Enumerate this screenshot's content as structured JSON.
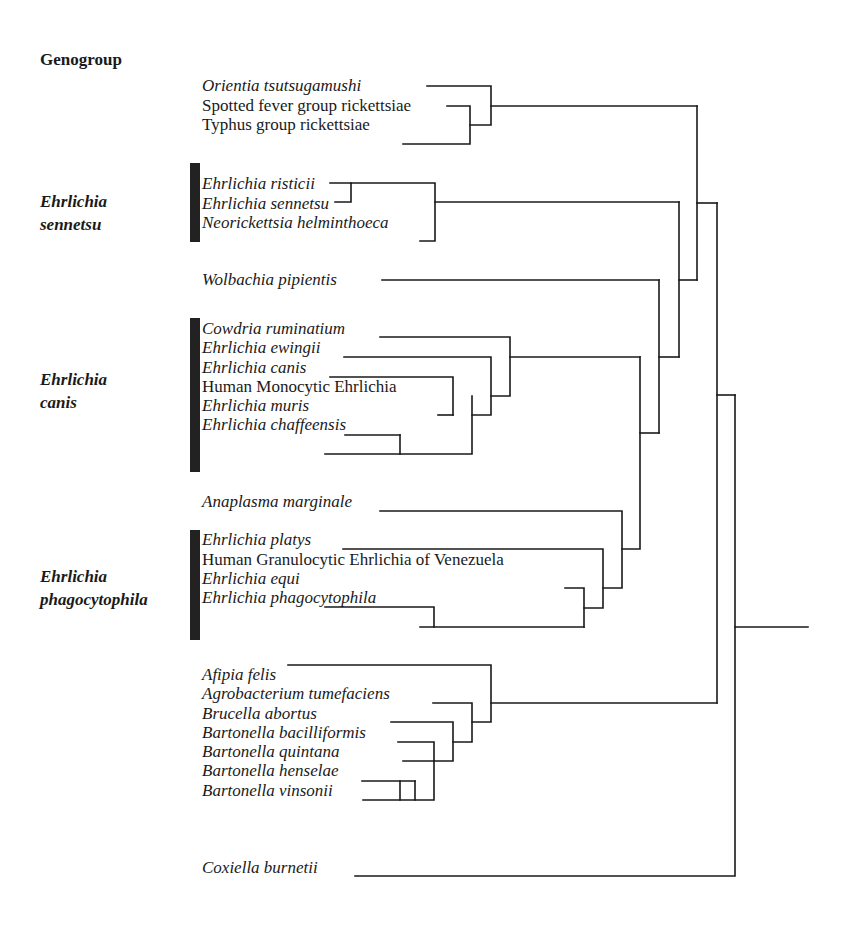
{
  "header": {
    "title": "Genogroup"
  },
  "groups": [
    {
      "name": "Ehrlichia sennetsu",
      "line1": "Ehrlichia",
      "line2": "sennetsu"
    },
    {
      "name": "Ehrlichia canis",
      "line1": "Ehrlichia",
      "line2": "canis"
    },
    {
      "name": "Ehrlichia phagocytophila",
      "line1": "Ehrlichia",
      "line2": "phagocytophila"
    }
  ],
  "taxa": [
    {
      "label": "Orientia tsutsugamushi",
      "italic": true
    },
    {
      "label": "Spotted fever group rickettsiae",
      "italic": false
    },
    {
      "label": "Typhus group rickettsiae",
      "italic": false
    },
    {
      "label": "Ehrlichia risticii",
      "italic": true
    },
    {
      "label": "Ehrlichia sennetsu",
      "italic": true
    },
    {
      "label": "Neorickettsia helminthoeca",
      "italic": true
    },
    {
      "label": "Wolbachia pipientis",
      "italic": true
    },
    {
      "label": "Cowdria ruminatium",
      "italic": true
    },
    {
      "label": "Ehrlichia ewingii",
      "italic": true
    },
    {
      "label": "Ehrlichia canis",
      "italic": true
    },
    {
      "label": "Human Monocytic Ehrlichia",
      "italic": false
    },
    {
      "label": "Ehrlichia muris",
      "italic": true
    },
    {
      "label": "Ehrlichia chaffeensis",
      "italic": true
    },
    {
      "label": "Anaplasma marginale",
      "italic": true
    },
    {
      "label": "Ehrlichia platys",
      "italic": true
    },
    {
      "label": "Human Granulocytic Ehrlichia of Venezuela",
      "italic": false
    },
    {
      "label": "Ehrlichia equi",
      "italic": true
    },
    {
      "label": "Ehrlichia phagocytophila",
      "italic": true
    },
    {
      "label": "Afipia felis",
      "italic": true
    },
    {
      "label": "Agrobacterium tumefaciens",
      "italic": true
    },
    {
      "label": "Brucella abortus",
      "italic": true
    },
    {
      "label": "Bartonella bacilliformis",
      "italic": true
    },
    {
      "label": "Bartonella quintana",
      "italic": true
    },
    {
      "label": "Bartonella henselae",
      "italic": true
    },
    {
      "label": "Bartonella vinsonii",
      "italic": true
    },
    {
      "label": "Coxiella burnetii",
      "italic": true
    }
  ],
  "colors": {
    "line": "#1a1a1a",
    "bar": "#222222",
    "background": "#ffffff"
  }
}
